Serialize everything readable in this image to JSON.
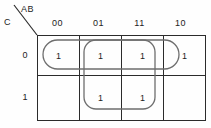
{
  "diagram": {
    "kind": "karnaugh-map",
    "corner": {
      "column_vars": "AB",
      "row_vars": "C"
    },
    "column_headers": [
      "00",
      "01",
      "11",
      "10"
    ],
    "row_headers": [
      "0",
      "1"
    ],
    "cells": [
      [
        "1",
        "1",
        "1",
        "1"
      ],
      [
        "",
        "1",
        "1",
        ""
      ]
    ],
    "groups": [
      {
        "name": "group-top-row",
        "shape": "oval",
        "covers": "row 0, columns 00 01 11 10"
      },
      {
        "name": "group-middle-block",
        "shape": "rounded-rectangle",
        "covers": "rows 0 and 1, columns 01 and 11"
      }
    ],
    "colors": {
      "grid_line": "#2b2b2b",
      "group_line": "#6e6e6e",
      "background": "#fefefe",
      "text": "#1f1f1f"
    }
  }
}
